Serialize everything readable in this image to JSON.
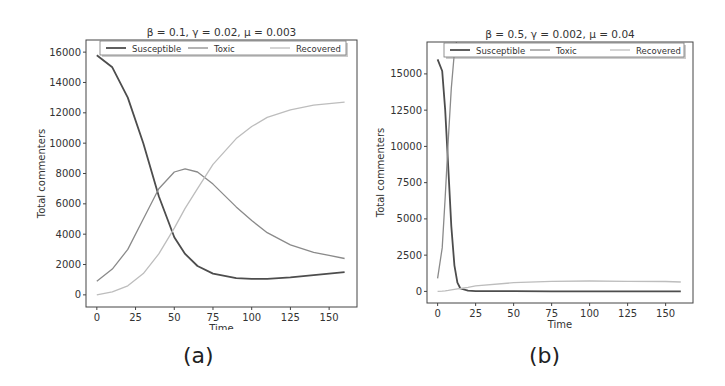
{
  "chart_data": [
    {
      "type": "line",
      "caption": "(a)",
      "title": "β = 0.1, γ = 0.02, μ = 0.003",
      "xlabel": "Time",
      "ylabel": "Total commenters",
      "xlim": [
        -7,
        168
      ],
      "ylim": [
        -800,
        16800
      ],
      "xticks": [
        0,
        25,
        50,
        75,
        100,
        125,
        150
      ],
      "yticks": [
        0,
        2000,
        4000,
        6000,
        8000,
        10000,
        12000,
        14000,
        16000
      ],
      "grid": false,
      "legend_position": "upper center",
      "x": [
        0,
        10,
        20,
        30,
        40,
        50,
        57,
        65,
        75,
        90,
        100,
        110,
        125,
        140,
        150,
        160
      ],
      "series": [
        {
          "name": "Susceptible",
          "color": "#4d4d4d",
          "values": [
            15800,
            15000,
            13000,
            10000,
            6500,
            3800,
            2700,
            1900,
            1400,
            1100,
            1050,
            1050,
            1150,
            1300,
            1400,
            1500
          ]
        },
        {
          "name": "Toxic",
          "color": "#8a8a8a",
          "values": [
            900,
            1700,
            3000,
            5000,
            7000,
            8100,
            8300,
            8100,
            7300,
            5800,
            4900,
            4100,
            3300,
            2800,
            2600,
            2400
          ]
        },
        {
          "name": "Recovered",
          "color": "#bdbdbd",
          "values": [
            0,
            200,
            600,
            1400,
            2700,
            4400,
            5700,
            7000,
            8600,
            10300,
            11100,
            11700,
            12200,
            12500,
            12600,
            12700
          ]
        }
      ]
    },
    {
      "type": "line",
      "caption": "(b)",
      "title": "β = 0.5, γ = 0.002, μ = 0.04",
      "xlabel": "Time",
      "ylabel": "Total commenters",
      "xlim": [
        -7,
        168
      ],
      "ylim": [
        -800,
        17200
      ],
      "xticks": [
        0,
        25,
        50,
        75,
        100,
        125,
        150
      ],
      "yticks": [
        0,
        2500,
        5000,
        7500,
        10000,
        12500,
        15000
      ],
      "grid": false,
      "legend_position": "upper center",
      "x": [
        0,
        3,
        5,
        7,
        9,
        11,
        13,
        15,
        20,
        25,
        50,
        75,
        100,
        125,
        150,
        160
      ],
      "series": [
        {
          "name": "Susceptible",
          "color": "#4d4d4d",
          "values": [
            16000,
            15200,
            12500,
            8500,
            4500,
            1800,
            600,
            200,
            50,
            20,
            20,
            10,
            10,
            5,
            5,
            5
          ]
        },
        {
          "name": "Toxic",
          "color": "#8a8a8a",
          "values": [
            900,
            3000,
            6500,
            10500,
            14000,
            16500,
            17500,
            18000,
            18000,
            18000,
            18000,
            18000,
            18000,
            18000,
            18000,
            18000
          ]
        },
        {
          "name": "Recovered",
          "color": "#bdbdbd",
          "values": [
            0,
            20,
            40,
            70,
            100,
            140,
            170,
            200,
            280,
            380,
            600,
            700,
            720,
            700,
            680,
            650
          ]
        }
      ]
    }
  ]
}
